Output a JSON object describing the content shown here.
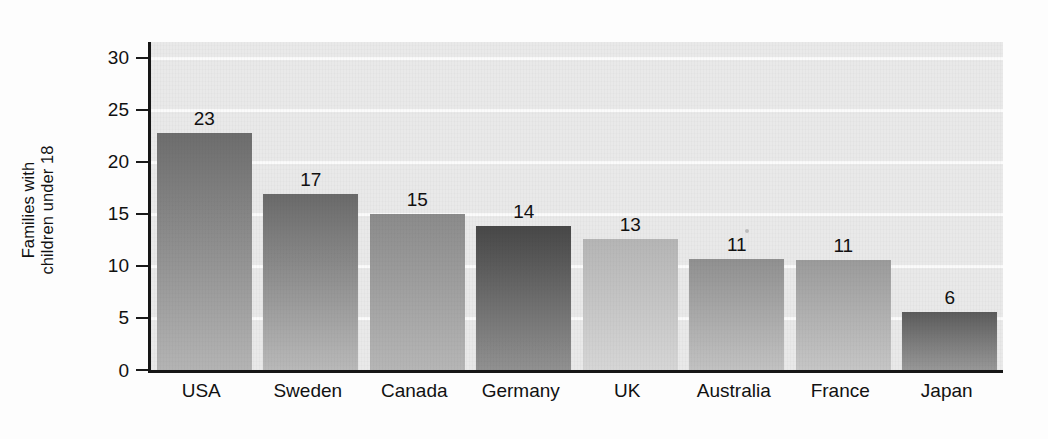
{
  "chart_data": {
    "type": "bar",
    "title": "",
    "subtitle": "",
    "xlabel": "",
    "ylabel": "Families with children under 18",
    "ylabel_lines": [
      "Families with",
      "children under 18"
    ],
    "categories": [
      "USA",
      "Sweden",
      "Canada",
      "Germany",
      "UK",
      "Australia",
      "France",
      "Japan"
    ],
    "values": [
      22.8,
      16.9,
      15.0,
      13.8,
      12.6,
      10.7,
      10.6,
      5.6
    ],
    "data_labels": [
      "23",
      "17",
      "15",
      "14",
      "13",
      "11",
      "11",
      "6"
    ],
    "ylim": [
      0,
      31.5
    ],
    "yticks": [
      0,
      5,
      10,
      15,
      20,
      25,
      30
    ],
    "ytick_labels": [
      "0",
      "5",
      "10",
      "15",
      "20",
      "25",
      "30"
    ],
    "grid": "horizontal",
    "legend": "none",
    "bar_styles": [
      {
        "name": "USA",
        "top": "#6d6d6d",
        "bottom": "#b4b4b4"
      },
      {
        "name": "Sweden",
        "top": "#6a6a6a",
        "bottom": "#b9b9b9"
      },
      {
        "name": "Canada",
        "top": "#8b8b8b",
        "bottom": "#b6b6b6"
      },
      {
        "name": "Germany",
        "top": "#474747",
        "bottom": "#919191"
      },
      {
        "name": "UK",
        "top": "#b5b5b5",
        "bottom": "#d6d6d6"
      },
      {
        "name": "Australia",
        "top": "#909090",
        "bottom": "#c2c2c2"
      },
      {
        "name": "France",
        "top": "#9b9b9b",
        "bottom": "#c6c6c6"
      },
      {
        "name": "Japan",
        "top": "#5c5c5c",
        "bottom": "#989898"
      }
    ],
    "plot_background": "#e9e9e9",
    "gridline_color": "#fbfbfb",
    "axis_color": "#161616",
    "text_color": "#111111"
  }
}
